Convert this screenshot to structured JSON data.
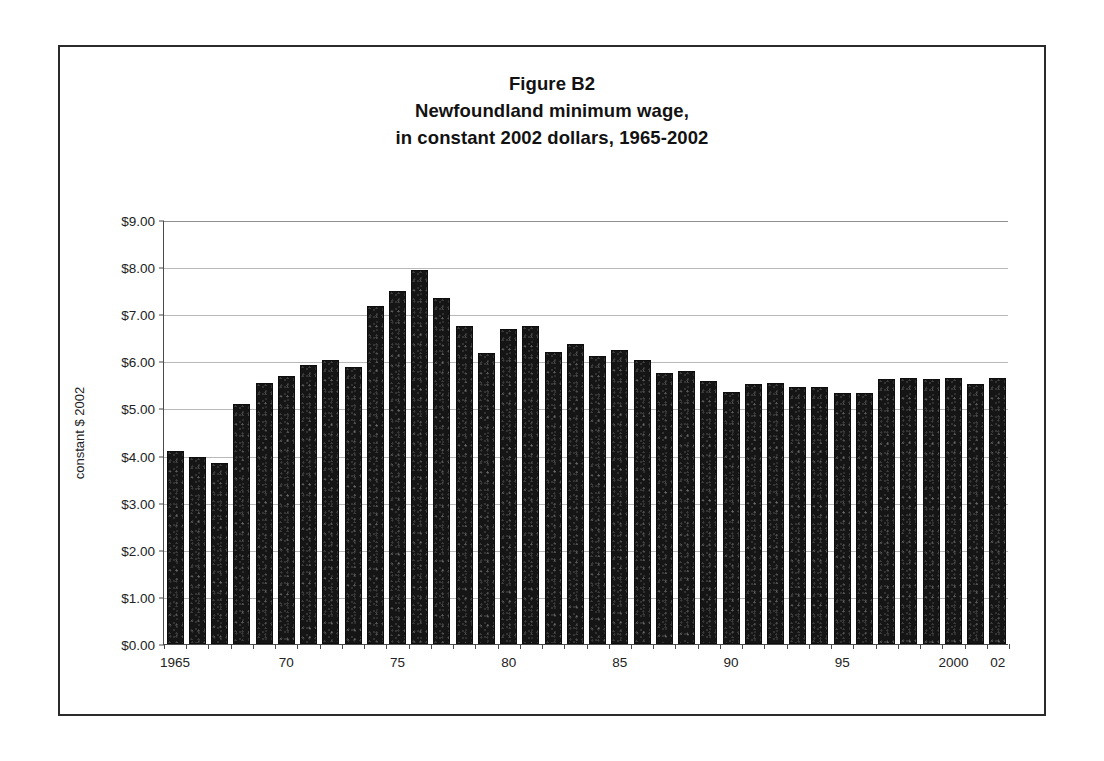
{
  "figure": {
    "title_lines": [
      "Figure B2",
      "Newfoundland minimum wage,",
      "in constant 2002 dollars, 1965-2002"
    ],
    "frame_color": "#2b2b2b",
    "bar_color": "#151515",
    "gridline_color": "#b9b9b9"
  },
  "chart_data": {
    "type": "bar",
    "title": "Figure B2 Newfoundland minimum wage, in constant 2002 dollars, 1965-2002",
    "xlabel": "",
    "ylabel": "constant $ 2002",
    "ylim": [
      0,
      9
    ],
    "ytick_values": [
      0,
      1,
      2,
      3,
      4,
      5,
      6,
      7,
      8,
      9
    ],
    "ytick_labels": [
      "$0.00",
      "$1.00",
      "$2.00",
      "$3.00",
      "$4.00",
      "$5.00",
      "$6.00",
      "$7.00",
      "$8.00",
      "$9.00"
    ],
    "grid": true,
    "legend": null,
    "categories": [
      1965,
      1966,
      1967,
      1968,
      1969,
      1970,
      1971,
      1972,
      1973,
      1974,
      1975,
      1976,
      1977,
      1978,
      1979,
      1980,
      1981,
      1982,
      1983,
      1984,
      1985,
      1986,
      1987,
      1988,
      1989,
      1990,
      1991,
      1992,
      1993,
      1994,
      1995,
      1996,
      1997,
      1998,
      1999,
      2000,
      2001,
      2002
    ],
    "xtick_labels": [
      {
        "category": 1965,
        "label": "1965"
      },
      {
        "category": 1970,
        "label": "70"
      },
      {
        "category": 1975,
        "label": "75"
      },
      {
        "category": 1980,
        "label": "80"
      },
      {
        "category": 1985,
        "label": "85"
      },
      {
        "category": 1990,
        "label": "90"
      },
      {
        "category": 1995,
        "label": "95"
      },
      {
        "category": 2000,
        "label": "2000"
      },
      {
        "category": 2002,
        "label": "02"
      }
    ],
    "values": [
      4.1,
      3.96,
      3.84,
      5.1,
      5.54,
      5.68,
      5.92,
      6.03,
      5.87,
      7.17,
      7.5,
      7.93,
      7.34,
      6.75,
      6.17,
      6.68,
      6.74,
      6.19,
      6.36,
      6.11,
      6.25,
      6.02,
      5.76,
      5.79,
      5.59,
      5.34,
      5.51,
      5.55,
      5.46,
      5.45,
      5.33,
      5.33,
      5.63,
      5.64,
      5.63,
      5.64,
      5.52,
      5.64
    ]
  }
}
